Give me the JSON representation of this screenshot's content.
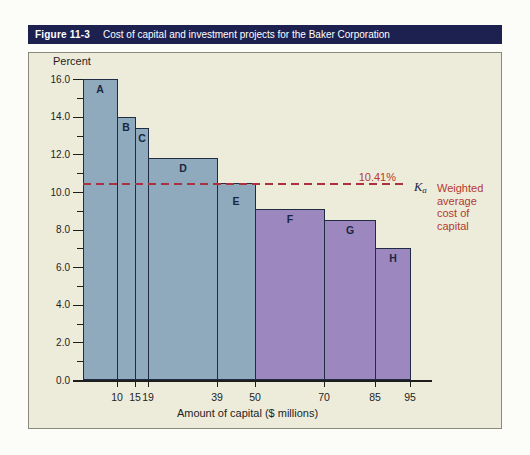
{
  "figure_header": {
    "label": "Figure 11-3",
    "title": "Cost of capital and investment projects for the Baker Corporation"
  },
  "chart_data": {
    "type": "bar",
    "title": "Cost of capital and investment projects for the Baker Corporation",
    "ylabel": "Percent",
    "xlabel": "Amount of capital ($ millions)",
    "xlim": [
      0,
      102
    ],
    "ylim": [
      0,
      16
    ],
    "y_major_tick_step": 2,
    "y_minor_tick_step": 1,
    "grid": "off",
    "x_boundary_labels": [
      10,
      15,
      19,
      39,
      50,
      70,
      85,
      95
    ],
    "bars": [
      {
        "name": "A",
        "x_start": 0,
        "x_end": 10,
        "value": 16.0,
        "group": "blue"
      },
      {
        "name": "B",
        "x_start": 10,
        "x_end": 15,
        "value": 14.0,
        "group": "blue"
      },
      {
        "name": "C",
        "x_start": 15,
        "x_end": 19,
        "value": 13.4,
        "group": "blue"
      },
      {
        "name": "D",
        "x_start": 19,
        "x_end": 39,
        "value": 11.8,
        "group": "blue"
      },
      {
        "name": "E",
        "x_start": 39,
        "x_end": 50,
        "value": 10.5,
        "group": "blue"
      },
      {
        "name": "F",
        "x_start": 50,
        "x_end": 70,
        "value": 9.1,
        "group": "purple"
      },
      {
        "name": "G",
        "x_start": 70,
        "x_end": 85,
        "value": 8.5,
        "group": "purple"
      },
      {
        "name": "H",
        "x_start": 85,
        "x_end": 95,
        "value": 7.0,
        "group": "purple"
      }
    ],
    "wacc_line": {
      "value": 10.41,
      "label": "10.41%",
      "symbol": "K",
      "symbol_sub": "a",
      "annotation": "Weighted\naverage\ncost of\ncapital"
    }
  },
  "colors": {
    "header_bg": "#1c2150",
    "header_text": "#ffffff",
    "panel_bg": "#edecdb",
    "panel_border": "#8b897c",
    "bar_blue": "#8fa9bd",
    "bar_purple": "#9c88bf",
    "bar_border": "#202c44",
    "bar_label": "#1a2742",
    "dash_red": "#ab3040",
    "accent_red": "#b5392e",
    "axis_text": "#1e1e1e"
  }
}
